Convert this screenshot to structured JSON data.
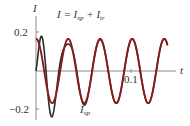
{
  "chart_data": {
    "type": "line",
    "title": "",
    "xlabel": "t",
    "ylabel": "I",
    "x_ticks": [
      {
        "value": 0.1,
        "label": "0.1"
      }
    ],
    "y_ticks": [
      {
        "value": 0.2,
        "label": "0.2"
      },
      {
        "value": -0.2,
        "label": "−0.2"
      }
    ],
    "xlim": [
      0,
      0.145
    ],
    "ylim": [
      -0.25,
      0.25
    ],
    "grid": false,
    "annotations": [
      {
        "text": "I = I_sp + I_tr",
        "target": "total",
        "position": "top-center"
      },
      {
        "text": "I_sp",
        "target": "steady-periodic",
        "position": "bottom"
      }
    ],
    "series": [
      {
        "name": "I_sp",
        "description": "steady periodic solution",
        "color": "#8b1a1a",
        "amplitude": 0.165,
        "period": 0.0337,
        "initial_value": 0.16,
        "x": [
          0,
          0.008,
          0.017,
          0.025,
          0.034,
          0.042,
          0.051,
          0.059,
          0.068,
          0.076,
          0.085,
          0.093,
          0.101,
          0.11,
          0.118,
          0.126,
          0.135,
          0.143
        ],
        "values": [
          0.16,
          0.02,
          -0.16,
          -0.02,
          0.16,
          0.02,
          -0.16,
          -0.02,
          0.16,
          0.02,
          -0.16,
          -0.02,
          0.16,
          0.02,
          -0.16,
          -0.02,
          0.16,
          0.0
        ]
      },
      {
        "name": "I",
        "description": "I = I_sp + I_tr (total current)",
        "color": "#2b2b2b",
        "initial_value": 0.0,
        "x": [
          0,
          0.008,
          0.014,
          0.02,
          0.032,
          0.042,
          0.053,
          0.066,
          0.085,
          0.101,
          0.12
        ],
        "values": [
          0.0,
          0.12,
          0.02,
          -0.23,
          0.21,
          0.02,
          -0.13,
          0.18,
          -0.16,
          0.16,
          -0.16
        ]
      }
    ]
  },
  "labels": {
    "y_axis": "I",
    "x_axis": "t",
    "tick_y_pos": "0.2",
    "tick_y_neg": "−0.2",
    "tick_x": "0.1",
    "total_label_main": "I = I",
    "total_label_sub1": "sp",
    "total_label_plus": " + I",
    "total_label_sub2": "tr",
    "sp_label_main": "I",
    "sp_label_sub": "sp"
  },
  "colors": {
    "steady": "#8b1a1a",
    "total": "#2b2b2b",
    "axis": "#7a7a7a"
  }
}
